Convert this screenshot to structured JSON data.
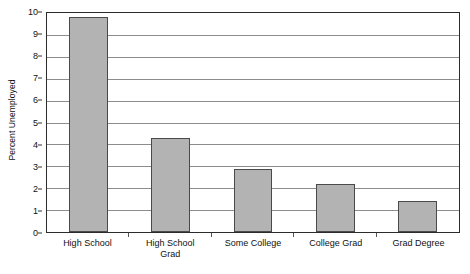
{
  "chart_data": {
    "type": "bar",
    "title": "",
    "xlabel": "",
    "ylabel": "Percent Unemployed",
    "categories": [
      "High School",
      "High School Grad",
      "Some College",
      "College Grad",
      "Grad Degree"
    ],
    "values": [
      9.8,
      4.3,
      2.9,
      2.2,
      1.4
    ],
    "ylim": [
      0,
      10
    ],
    "ytick_values": [
      0,
      1,
      2,
      3,
      4,
      5,
      6,
      7,
      8,
      9,
      10
    ],
    "ytick_labels": [
      "0",
      "1",
      "2",
      "3",
      "4",
      "5",
      "6",
      "7",
      "8",
      "9",
      "10"
    ],
    "grid": true,
    "grid_axis": "y",
    "legend": false,
    "legend_position": "none",
    "bar_color": "#b3b3b3",
    "bar_border_color": "#4a4a4a",
    "gridline_color": "#8d8d8d",
    "axis_border_color": "#2b2b2b",
    "background_color": "#ffffff"
  },
  "x_axis": {
    "label_lines": [
      [
        "High School"
      ],
      [
        "High School",
        "Grad"
      ],
      [
        "Some College"
      ],
      [
        "College Grad"
      ],
      [
        "Grad Degree"
      ]
    ]
  }
}
